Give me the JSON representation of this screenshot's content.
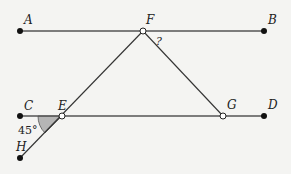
{
  "diagram": {
    "points": {
      "A": {
        "label": "A",
        "x": 20,
        "y": 31
      },
      "F": {
        "label": "F",
        "x": 143,
        "y": 31
      },
      "B": {
        "label": "B",
        "x": 264,
        "y": 31
      },
      "C": {
        "label": "C",
        "x": 20,
        "y": 116
      },
      "E": {
        "label": "E",
        "x": 62,
        "y": 116
      },
      "G": {
        "label": "G",
        "x": 223,
        "y": 116
      },
      "D": {
        "label": "D",
        "x": 264,
        "y": 116
      },
      "H": {
        "label": "H",
        "x": 20,
        "y": 158
      }
    },
    "angle_label": "45°",
    "unknown_angle_label": "?",
    "colors": {
      "line": "#555555",
      "point": "#111111",
      "angle_fill": "#b5b5b5",
      "background": "#f4f4f2"
    }
  }
}
